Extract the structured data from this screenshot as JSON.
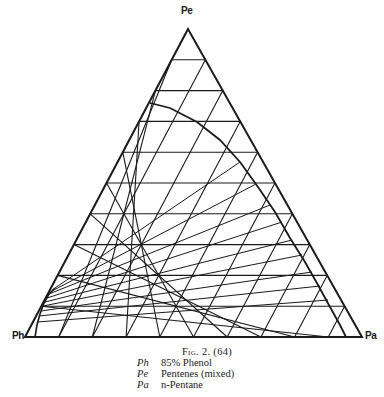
{
  "figure": {
    "title": "Fig. 2. (64)",
    "type": "ternary phase diagram"
  },
  "vertices": {
    "top": {
      "label": "Pe",
      "x": 188,
      "y": 29
    },
    "bottom_left": {
      "label": "Ph",
      "x": 25,
      "y": 337
    },
    "bottom_right": {
      "label": "Pa",
      "x": 362,
      "y": 337
    }
  },
  "grid": {
    "divisions": 10
  },
  "legend": [
    {
      "key": "Ph",
      "value": "85% Phenol"
    },
    {
      "key": "Pe",
      "value": "Pentenes (mixed)"
    },
    {
      "key": "Pa",
      "value": "n-Pentane"
    }
  ],
  "binodal_curve": {
    "outer_points": [
      [
        150,
        103
      ],
      [
        170,
        108
      ],
      [
        197,
        122
      ],
      [
        220,
        140
      ],
      [
        240,
        162
      ],
      [
        258,
        187
      ],
      [
        275,
        212
      ],
      [
        290,
        238
      ],
      [
        305,
        262
      ],
      [
        318,
        285
      ],
      [
        330,
        307
      ],
      [
        340,
        325
      ],
      [
        346,
        337
      ]
    ],
    "inner_points": [
      [
        35,
        337
      ],
      [
        37,
        325
      ],
      [
        40,
        314
      ],
      [
        44,
        303
      ],
      [
        49,
        294
      ],
      [
        55,
        288
      ]
    ]
  },
  "tie_lines": [
    [
      [
        55,
        288
      ],
      [
        240,
        162
      ]
    ],
    [
      [
        52,
        291
      ],
      [
        256,
        184
      ]
    ],
    [
      [
        49,
        294
      ],
      [
        270,
        205
      ]
    ],
    [
      [
        47,
        298
      ],
      [
        282,
        222
      ]
    ],
    [
      [
        45,
        302
      ],
      [
        292,
        240
      ]
    ],
    [
      [
        43,
        306
      ],
      [
        302,
        255
      ]
    ],
    [
      [
        41,
        311
      ],
      [
        312,
        272
      ]
    ],
    [
      [
        39,
        316
      ],
      [
        320,
        286
      ]
    ],
    [
      [
        37,
        322
      ],
      [
        328,
        300
      ]
    ]
  ],
  "colors": {
    "line": "#1a1a1a",
    "background": "#ffffff"
  }
}
